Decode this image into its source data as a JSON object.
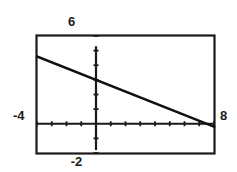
{
  "window": {
    "title": "Graphing Calculator Viewing Window"
  },
  "labels": {
    "ymax": "6",
    "ymin": "-2",
    "xmin": "-4",
    "xmax": "8"
  },
  "colors": {
    "background": "#ffffff",
    "frame": "#1a1a1a",
    "axis": "#1a1a1a",
    "curve": "#111111",
    "label_text": "#1a1a1a"
  },
  "chart_data": {
    "type": "line",
    "title": "",
    "subtitle": "",
    "xlabel": "",
    "ylabel": "",
    "xlim": [
      -4,
      8
    ],
    "ylim": [
      -2,
      6
    ],
    "grid": false,
    "legend_position": "none",
    "x_tick_step": 1,
    "y_tick_step": 1,
    "x_ticks": [
      -4,
      -3,
      -2,
      -1,
      0,
      1,
      2,
      3,
      4,
      5,
      6,
      7,
      8
    ],
    "y_ticks": [
      -2,
      -1,
      0,
      1,
      2,
      3,
      4,
      5,
      6
    ],
    "tick_labels_shown": false,
    "axes_drawn": [
      "x-axis",
      "y-axis"
    ],
    "annotations": [],
    "series": [
      {
        "name": "line",
        "type": "line",
        "equation": "y = -0.4x + 3",
        "slope": -0.4,
        "intercept": 3,
        "x": [
          -4,
          8
        ],
        "values": [
          4.6,
          -0.2
        ],
        "points": [
          {
            "x": -4,
            "y": 4.6
          },
          {
            "x": 0,
            "y": 3
          },
          {
            "x": 8,
            "y": -0.2
          }
        ]
      }
    ]
  }
}
